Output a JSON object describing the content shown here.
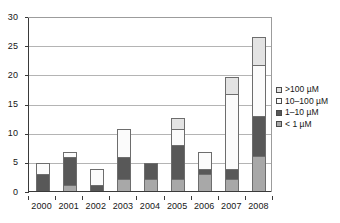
{
  "chart_data": {
    "type": "bar",
    "subtype": "stacked",
    "title": "",
    "xlabel": "",
    "ylabel": "",
    "categories": [
      "2000",
      "2001",
      "2002",
      "2003",
      "2004",
      "2005",
      "2006",
      "2007",
      "2008"
    ],
    "series": [
      {
        "name": "< 1 µM",
        "key": "lt1",
        "color": "#a8a8a8",
        "values": [
          0,
          1,
          0,
          2,
          2,
          2,
          3,
          2,
          6
        ]
      },
      {
        "name": "1–10 µM",
        "key": "1to10",
        "color": "#585858",
        "values": [
          3,
          5,
          1,
          4,
          3,
          6,
          1,
          2,
          7
        ]
      },
      {
        "name": "10–100 µM",
        "key": "10to100",
        "color": "#fbfbfb",
        "values": [
          2,
          1,
          3,
          5,
          0,
          3,
          3,
          13,
          9
        ]
      },
      {
        "name": "> 100 µM",
        "key": "gt100",
        "color": "#e3e3e3",
        "values": [
          0,
          0,
          0,
          0,
          0,
          2,
          0,
          3,
          5
        ]
      }
    ],
    "totals": [
      5,
      7,
      4,
      11,
      5,
      13,
      7,
      20,
      27
    ],
    "yticks": [
      0,
      5,
      10,
      15,
      20,
      25,
      30
    ],
    "ylim": [
      0,
      30
    ],
    "grid": true,
    "legend_position": "right"
  },
  "legend": {
    "items": [
      {
        "label": ">100 µM",
        "color": "#e3e3e3"
      },
      {
        "label": "10–100 µM",
        "color": "#fbfbfb"
      },
      {
        "label": "1–10 µM",
        "color": "#585858"
      },
      {
        "label": "< 1 µM",
        "color": "#a8a8a8"
      }
    ]
  },
  "axes": {
    "y_tick_labels": [
      "0",
      "5",
      "10",
      "15",
      "20",
      "25",
      "30"
    ],
    "x_tick_labels": [
      "2000",
      "2001",
      "2002",
      "2003",
      "2004",
      "2005",
      "2006",
      "2007",
      "2008"
    ]
  }
}
